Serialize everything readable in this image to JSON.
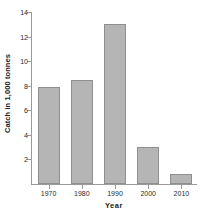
{
  "chart_data": {
    "type": "bar",
    "title": "",
    "subtitle": "",
    "xlabel": "Year",
    "ylabel": "Catch in 1,000 tonnes",
    "categories": [
      "1970",
      "1980",
      "1990",
      "2000",
      "2010"
    ],
    "values": [
      7.9,
      8.5,
      13.0,
      3.0,
      0.85
    ],
    "series": [
      {
        "name": "Catch",
        "values": [
          7.9,
          8.5,
          13.0,
          3.0,
          0.85
        ]
      }
    ],
    "ylim": [
      0,
      14
    ],
    "xlim_categories": 5,
    "ytick_labels": [
      "2",
      "4",
      "6",
      "8",
      "10",
      "12",
      "14"
    ],
    "ytick_values": [
      2,
      4,
      6,
      8,
      10,
      12,
      14
    ],
    "xtick_labels": [
      "1970",
      "1980",
      "1990",
      "2000",
      "2010"
    ],
    "grid": false,
    "legend": false,
    "legend_position": "none",
    "bar_color": "#b5b5b5",
    "bar_edge_color": "#8f8f8f",
    "axis_color": "#9a9a9a",
    "text_color": "#1a1a1a",
    "background_color": "#ffffff",
    "annotations": []
  }
}
